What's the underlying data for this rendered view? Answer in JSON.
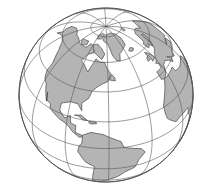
{
  "map": {
    "type": "orthographic-globe",
    "center": {
      "cx": 106,
      "cy": 95,
      "r": 87
    },
    "rotation": {
      "lon0": -62,
      "lat0": 38
    },
    "colors": {
      "ocean": "#ffffff",
      "land": "#b4b4b4",
      "lines": "#555555",
      "coast": "#444444"
    },
    "graticule": {
      "meridian_step_deg": 30,
      "parallel_step_deg": 20,
      "parallels": [
        -40,
        -20,
        0,
        20,
        40,
        60,
        80
      ],
      "meridians": [
        -180,
        -150,
        -120,
        -90,
        -60,
        -30,
        0,
        30,
        60,
        90,
        120,
        150
      ]
    },
    "regions_visible": [
      "North America",
      "South America",
      "Greenland",
      "Arctic",
      "Europe",
      "Africa"
    ],
    "land": [
      {
        "name": "North America",
        "coords": [
          [
            -168,
            66
          ],
          [
            -160,
            70
          ],
          [
            -150,
            71
          ],
          [
            -140,
            70
          ],
          [
            -128,
            70
          ],
          [
            -115,
            68
          ],
          [
            -100,
            68
          ],
          [
            -95,
            72
          ],
          [
            -85,
            70
          ],
          [
            -82,
            66
          ],
          [
            -90,
            64
          ],
          [
            -94,
            58
          ],
          [
            -88,
            56
          ],
          [
            -82,
            52
          ],
          [
            -80,
            56
          ],
          [
            -76,
            62
          ],
          [
            -70,
            60
          ],
          [
            -64,
            60
          ],
          [
            -61,
            56
          ],
          [
            -57,
            52
          ],
          [
            -60,
            47
          ],
          [
            -66,
            45
          ],
          [
            -70,
            43
          ],
          [
            -74,
            40
          ],
          [
            -76,
            35
          ],
          [
            -81,
            31
          ],
          [
            -80,
            26
          ],
          [
            -82,
            28
          ],
          [
            -84,
            30
          ],
          [
            -90,
            30
          ],
          [
            -97,
            27
          ],
          [
            -97,
            22
          ],
          [
            -92,
            18
          ],
          [
            -88,
            21
          ],
          [
            -87,
            16
          ],
          [
            -83,
            15
          ],
          [
            -83,
            10
          ],
          [
            -79,
            9
          ],
          [
            -77,
            8
          ],
          [
            -80,
            7
          ],
          [
            -85,
            10
          ],
          [
            -88,
            13
          ],
          [
            -92,
            15
          ],
          [
            -96,
            16
          ],
          [
            -105,
            20
          ],
          [
            -106,
            23
          ],
          [
            -110,
            24
          ],
          [
            -112,
            29
          ],
          [
            -110,
            23
          ],
          [
            -115,
            30
          ],
          [
            -117,
            33
          ],
          [
            -121,
            35
          ],
          [
            -124,
            40
          ],
          [
            -124,
            46
          ],
          [
            -127,
            50
          ],
          [
            -132,
            55
          ],
          [
            -140,
            59
          ],
          [
            -150,
            60
          ],
          [
            -158,
            58
          ],
          [
            -163,
            55
          ],
          [
            -160,
            60
          ],
          [
            -165,
            62
          ],
          [
            -168,
            66
          ]
        ]
      },
      {
        "name": "South America",
        "coords": [
          [
            -78,
            9
          ],
          [
            -72,
            12
          ],
          [
            -64,
            11
          ],
          [
            -60,
            9
          ],
          [
            -52,
            5
          ],
          [
            -50,
            0
          ],
          [
            -44,
            -2
          ],
          [
            -38,
            -4
          ],
          [
            -35,
            -8
          ],
          [
            -39,
            -14
          ],
          [
            -41,
            -22
          ],
          [
            -48,
            -26
          ],
          [
            -53,
            -33
          ],
          [
            -57,
            -36
          ],
          [
            -62,
            -40
          ],
          [
            -65,
            -45
          ],
          [
            -68,
            -51
          ],
          [
            -70,
            -54
          ],
          [
            -74,
            -50
          ],
          [
            -74,
            -42
          ],
          [
            -72,
            -30
          ],
          [
            -70,
            -18
          ],
          [
            -76,
            -14
          ],
          [
            -81,
            -5
          ],
          [
            -80,
            0
          ],
          [
            -78,
            3
          ],
          [
            -78,
            9
          ]
        ]
      },
      {
        "name": "Greenland",
        "coords": [
          [
            -72,
            78
          ],
          [
            -60,
            82
          ],
          [
            -40,
            83
          ],
          [
            -22,
            81
          ],
          [
            -18,
            76
          ],
          [
            -22,
            70
          ],
          [
            -30,
            68
          ],
          [
            -40,
            65
          ],
          [
            -43,
            60
          ],
          [
            -48,
            61
          ],
          [
            -52,
            65
          ],
          [
            -54,
            69
          ],
          [
            -58,
            74
          ],
          [
            -68,
            76
          ],
          [
            -72,
            78
          ]
        ]
      },
      {
        "name": "Baffin Island",
        "coords": [
          [
            -90,
            72
          ],
          [
            -80,
            73
          ],
          [
            -70,
            70
          ],
          [
            -64,
            66
          ],
          [
            -68,
            62
          ],
          [
            -74,
            64
          ],
          [
            -80,
            66
          ],
          [
            -86,
            69
          ],
          [
            -90,
            72
          ]
        ]
      },
      {
        "name": "Ellesmere",
        "coords": [
          [
            -92,
            80
          ],
          [
            -80,
            83
          ],
          [
            -68,
            82
          ],
          [
            -76,
            78
          ],
          [
            -88,
            77
          ],
          [
            -92,
            80
          ]
        ]
      },
      {
        "name": "Victoria Island",
        "coords": [
          [
            -118,
            72
          ],
          [
            -105,
            73
          ],
          [
            -102,
            70
          ],
          [
            -110,
            68
          ],
          [
            -118,
            70
          ],
          [
            -118,
            72
          ]
        ]
      },
      {
        "name": "Iceland",
        "coords": [
          [
            -24,
            65
          ],
          [
            -18,
            66.5
          ],
          [
            -14,
            65
          ],
          [
            -18,
            63.5
          ],
          [
            -22,
            64
          ],
          [
            -24,
            65
          ]
        ]
      },
      {
        "name": "Great Britain",
        "coords": [
          [
            -5,
            50
          ],
          [
            1,
            51
          ],
          [
            0,
            53
          ],
          [
            -2,
            56
          ],
          [
            -5,
            58
          ],
          [
            -6,
            56
          ],
          [
            -4,
            54
          ],
          [
            -5,
            50
          ]
        ]
      },
      {
        "name": "Ireland",
        "coords": [
          [
            -10,
            52
          ],
          [
            -6,
            52
          ],
          [
            -6,
            55
          ],
          [
            -9,
            54
          ],
          [
            -10,
            52
          ]
        ]
      },
      {
        "name": "Svalbard",
        "coords": [
          [
            12,
            78
          ],
          [
            20,
            80
          ],
          [
            26,
            79
          ],
          [
            18,
            77
          ],
          [
            12,
            78
          ]
        ]
      },
      {
        "name": "Europe",
        "coords": [
          [
            -9,
            43
          ],
          [
            -9,
            37
          ],
          [
            -5,
            36
          ],
          [
            0,
            39
          ],
          [
            3,
            43
          ],
          [
            8,
            44
          ],
          [
            12,
            42
          ],
          [
            16,
            38
          ],
          [
            18,
            40
          ],
          [
            14,
            44
          ],
          [
            20,
            40
          ],
          [
            24,
            38
          ],
          [
            26,
            41
          ],
          [
            30,
            41
          ],
          [
            40,
            41
          ],
          [
            40,
            46
          ],
          [
            30,
            46
          ],
          [
            40,
            47
          ],
          [
            45,
            45
          ],
          [
            50,
            50
          ],
          [
            60,
            55
          ],
          [
            60,
            69
          ],
          [
            45,
            68
          ],
          [
            40,
            66
          ],
          [
            35,
            70
          ],
          [
            28,
            71
          ],
          [
            18,
            70
          ],
          [
            14,
            67
          ],
          [
            10,
            63
          ],
          [
            5,
            62
          ],
          [
            5,
            58
          ],
          [
            8,
            58
          ],
          [
            11,
            59
          ],
          [
            13,
            56
          ],
          [
            10,
            54
          ],
          [
            5,
            53
          ],
          [
            2,
            51
          ],
          [
            -2,
            48
          ],
          [
            -4,
            48
          ],
          [
            -1,
            46
          ],
          [
            -2,
            43
          ],
          [
            -9,
            43
          ]
        ]
      },
      {
        "name": "Scandinavia-inner",
        "coords": [
          [
            13,
            56
          ],
          [
            18,
            59
          ],
          [
            22,
            61
          ],
          [
            25,
            65
          ],
          [
            22,
            66
          ],
          [
            18,
            63
          ],
          [
            17,
            60
          ],
          [
            13,
            56
          ]
        ]
      },
      {
        "name": "Africa",
        "coords": [
          [
            -17,
            15
          ],
          [
            -17,
            21
          ],
          [
            -13,
            27
          ],
          [
            -9,
            32
          ],
          [
            -6,
            36
          ],
          [
            0,
            36
          ],
          [
            10,
            37
          ],
          [
            11,
            33
          ],
          [
            20,
            31
          ],
          [
            30,
            31
          ],
          [
            33,
            31
          ],
          [
            35,
            28
          ],
          [
            38,
            22
          ],
          [
            43,
            12
          ],
          [
            51,
            12
          ],
          [
            48,
            5
          ],
          [
            40,
            -3
          ],
          [
            40,
            -15
          ],
          [
            35,
            -24
          ],
          [
            32,
            -29
          ],
          [
            26,
            -34
          ],
          [
            20,
            -35
          ],
          [
            18,
            -30
          ],
          [
            14,
            -22
          ],
          [
            12,
            -12
          ],
          [
            13,
            -5
          ],
          [
            9,
            -1
          ],
          [
            9,
            4
          ],
          [
            5,
            5
          ],
          [
            -4,
            5
          ],
          [
            -8,
            4
          ],
          [
            -13,
            8
          ],
          [
            -16,
            11
          ],
          [
            -17,
            15
          ]
        ]
      },
      {
        "name": "Cuba",
        "coords": [
          [
            -85,
            22
          ],
          [
            -80,
            23
          ],
          [
            -75,
            20
          ],
          [
            -78,
            20
          ],
          [
            -82,
            22
          ],
          [
            -85,
            22
          ]
        ]
      },
      {
        "name": "Hispaniola",
        "coords": [
          [
            -74,
            19.8
          ],
          [
            -69,
            19.5
          ],
          [
            -68.5,
            18.5
          ],
          [
            -72,
            18
          ],
          [
            -74,
            18.5
          ],
          [
            -74,
            19.8
          ]
        ]
      },
      {
        "name": "Newfoundland",
        "coords": [
          [
            -59,
            48
          ],
          [
            -56,
            51.5
          ],
          [
            -53,
            49
          ],
          [
            -53,
            47
          ],
          [
            -56,
            47.5
          ],
          [
            -59,
            48
          ]
        ]
      }
    ]
  }
}
